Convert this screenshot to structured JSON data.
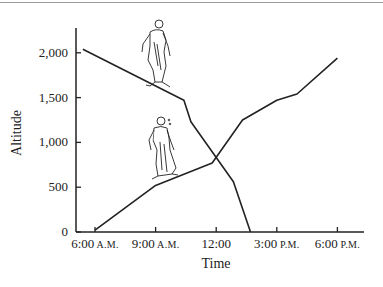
{
  "chart_data": {
    "type": "line",
    "title": "",
    "xlabel": "Time",
    "ylabel": "Altitude",
    "x_ticks": [
      {
        "hour": 6,
        "label": "6:00",
        "suffix": "A.M."
      },
      {
        "hour": 9,
        "label": "9:00",
        "suffix": "A.M."
      },
      {
        "hour": 12,
        "label": "12:00",
        "suffix": ""
      },
      {
        "hour": 15,
        "label": "3:00",
        "suffix": "P.M."
      },
      {
        "hour": 18,
        "label": "6:00",
        "suffix": "P.M."
      }
    ],
    "y_ticks": [
      {
        "value": 0,
        "label": "0"
      },
      {
        "value": 500,
        "label": "500"
      },
      {
        "value": 1000,
        "label": "1,000"
      },
      {
        "value": 1500,
        "label": "1,500"
      },
      {
        "value": 2000,
        "label": "2,000"
      }
    ],
    "ylim": [
      0,
      2300
    ],
    "xlim": [
      5,
      19.5
    ],
    "grid": false,
    "legend": "none",
    "series": [
      {
        "name": "Descending monk",
        "points": [
          [
            5.4,
            2040
          ],
          [
            10.4,
            1470
          ],
          [
            10.75,
            1230
          ],
          [
            12.85,
            560
          ],
          [
            13.7,
            0
          ]
        ]
      },
      {
        "name": "Ascending monk",
        "points": [
          [
            6.0,
            20
          ],
          [
            9.0,
            520
          ],
          [
            11.8,
            770
          ],
          [
            13.3,
            1250
          ],
          [
            15.0,
            1470
          ],
          [
            16.0,
            1540
          ],
          [
            18.0,
            1940
          ]
        ]
      }
    ],
    "annotations": [
      "monk figure walking down slope (upper)",
      "monk figure walking up slope (lower)",
      "lines intersect near 12:00 at ~850"
    ]
  }
}
